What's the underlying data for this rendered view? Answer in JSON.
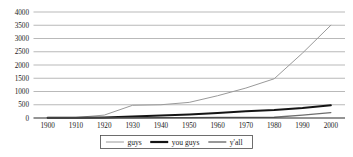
{
  "chart_data": {
    "type": "line",
    "title": "",
    "subtitle": "",
    "xlabel": "",
    "ylabel": "",
    "x": [
      1900,
      1910,
      1920,
      1930,
      1940,
      1950,
      1960,
      1970,
      1980,
      1990,
      2000
    ],
    "categories": [
      "1900",
      "1910",
      "1920",
      "1930",
      "1940",
      "1950",
      "1960",
      "1970",
      "1980",
      "1990",
      "2000"
    ],
    "xlim": [
      1895,
      2005
    ],
    "ylim": [
      0,
      4000
    ],
    "y_ticks": [
      0,
      500,
      1000,
      1500,
      2000,
      2500,
      3000,
      3500,
      4000
    ],
    "y_tick_labels": [
      "0",
      "500",
      "1000",
      "1500",
      "2000",
      "2500",
      "3000",
      "3500",
      "4000"
    ],
    "x_ticks": [
      1900,
      1910,
      1920,
      1930,
      1940,
      1950,
      1960,
      1970,
      1980,
      1990,
      2000
    ],
    "x_tick_labels": [
      "1900",
      "1910",
      "1920",
      "1930",
      "1940",
      "1950",
      "1960",
      "1970",
      "1980",
      "1990",
      "2000"
    ],
    "grid": "horizontal",
    "legend_position": "bottom-center",
    "series": [
      {
        "name": "guys",
        "color": "#9a9a9a",
        "line_width": 1.0,
        "values": [
          10,
          20,
          110,
          480,
          500,
          590,
          840,
          1130,
          1480,
          2450,
          3500
        ]
      },
      {
        "name": "you guys",
        "color": "#141414",
        "line_width": 2.0,
        "values": [
          5,
          8,
          20,
          55,
          95,
          135,
          190,
          255,
          300,
          375,
          480
        ]
      },
      {
        "name": "y'all",
        "color": "#6e6e6e",
        "line_width": 1.3,
        "values": [
          2,
          3,
          5,
          8,
          12,
          16,
          20,
          24,
          28,
          110,
          205
        ]
      }
    ]
  },
  "legend": {
    "items": [
      {
        "label": "guys",
        "color": "#9a9a9a",
        "line_width": 1.0
      },
      {
        "label": "you guys",
        "color": "#141414",
        "line_width": 2.2
      },
      {
        "label": "y'all",
        "color": "#6e6e6e",
        "line_width": 1.4
      }
    ]
  },
  "colors": {
    "background": "#ffffff",
    "gridline": "#8a8a8a",
    "axis": "#2b2b2b",
    "text": "#1a1a1a",
    "legend_border": "#4a4a4a"
  }
}
